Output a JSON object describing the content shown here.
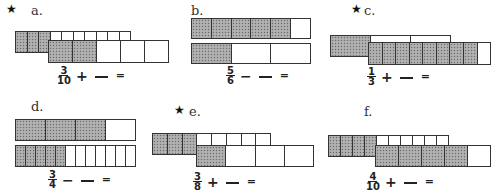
{
  "worksheet": {
    "problems": [
      {
        "id": "a",
        "label": "a.",
        "starred": true,
        "expression": {
          "numerator": "3",
          "denominator": "10",
          "operator": "+",
          "equals": "="
        },
        "bars": [
          {
            "cells": 10,
            "shaded": 3
          },
          {
            "cells": 5,
            "shaded": 2
          }
        ]
      },
      {
        "id": "b",
        "label": "b.",
        "starred": false,
        "expression": {
          "numerator": "5",
          "denominator": "6",
          "operator": "−",
          "equals": "="
        },
        "bars": [
          {
            "cells": 6,
            "shaded": 5
          },
          {
            "cells": 3,
            "shaded": 1
          }
        ]
      },
      {
        "id": "c",
        "label": "c.",
        "starred": true,
        "expression": {
          "numerator": "1",
          "denominator": "3",
          "operator": "+",
          "equals": "="
        },
        "bars": [
          {
            "cells": 3,
            "shaded": 1
          },
          {
            "cells": 9,
            "shaded": 8
          }
        ]
      },
      {
        "id": "d",
        "label": "d.",
        "starred": false,
        "expression": {
          "numerator": "3",
          "denominator": "4",
          "operator": "−",
          "equals": "="
        },
        "bars": [
          {
            "cells": 4,
            "shaded": 3
          },
          {
            "cells": 12,
            "shaded": 5
          }
        ]
      },
      {
        "id": "e",
        "label": "e.",
        "starred": true,
        "expression": {
          "numerator": "3",
          "denominator": "8",
          "operator": "+",
          "equals": "="
        },
        "bars": [
          {
            "cells": 8,
            "shaded": 3
          },
          {
            "cells": 4,
            "shaded": 1
          }
        ]
      },
      {
        "id": "f",
        "label": "f.",
        "starred": false,
        "expression": {
          "numerator": "4",
          "denominator": "10",
          "operator": "+",
          "equals": "="
        },
        "bars": [
          {
            "cells": 10,
            "shaded": 4
          },
          {
            "cells": 5,
            "shaded": 4
          }
        ]
      }
    ],
    "star_glyph": "★",
    "colors": {
      "shade": "#a8a8a8",
      "line": "#333333",
      "background": "#ffffff"
    }
  }
}
